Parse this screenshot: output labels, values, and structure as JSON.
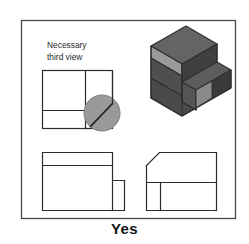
{
  "figure": {
    "caption": "Yes",
    "annotation": {
      "line1": "Necessary",
      "line2": "third view"
    },
    "frame": {
      "x": 21,
      "y": 20,
      "width": 214,
      "height": 198,
      "stroke": "#4a4a4a",
      "fill": "#ffffff"
    },
    "colors": {
      "line": "#2b2b2b",
      "frame_line": "#4a4a4a",
      "highlight_circle_fill": "#9a9a9a",
      "highlight_circle_stroke": "#7d7d7d",
      "iso_top_face": "#6e6e6e",
      "iso_top_face_low": "#5d5d5d",
      "iso_left_face": "#8e8e8e",
      "iso_left_face_dark": "#4f4f4f",
      "iso_front_face": "#5a5a5a",
      "iso_front_face_light": "#8a8a8a",
      "iso_right_face": "#454545",
      "iso_outline": "#2f2f2f",
      "caption_text": "#151515",
      "annotation_text": "#2b2b2b",
      "page_background": "#ffffff"
    }
  },
  "views": {
    "top_left": {
      "name": "Necessary third view (side view placeholder)",
      "x": 42,
      "y": 70,
      "width": 70,
      "height": 58,
      "vertical_divider_x": 85,
      "horizontal_divider_y": 110
    },
    "bottom_left": {
      "name": "Front view (stepped L outline)",
      "x": 42,
      "y": 152,
      "width": 70,
      "height": 58,
      "step_x": 85,
      "step_y": 180,
      "notch_x": 96,
      "top_band_y": 164
    },
    "bottom_right": {
      "name": "Top view (chamfered corner)",
      "x": 146,
      "y": 152,
      "width": 70,
      "height": 58,
      "chamfer_size": 13,
      "horizontal_divider_y": 182,
      "vertical_divider_x": 160
    },
    "isometric": {
      "name": "Pictorial isometric solid",
      "x": 150,
      "y": 24,
      "width": 80,
      "height": 78
    }
  },
  "highlight": {
    "name": "missing-feature-circle",
    "cx": 102,
    "cy": 113,
    "r": 18
  }
}
